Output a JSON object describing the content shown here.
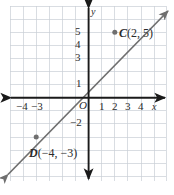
{
  "figure": {
    "type": "coordinate-plane",
    "title": "",
    "width": 174,
    "height": 195,
    "background": "#ffffff",
    "grid": {
      "visible": true,
      "color": "#c9cfd6",
      "cell_px": 13.1,
      "x_range": [
        -6,
        6
      ],
      "y_range": [
        -6,
        7
      ]
    },
    "axes": {
      "color": "#1a1a1a",
      "x_label": "x",
      "y_label": "y",
      "origin_label": "O",
      "x_ticks": [
        "−4",
        "−3",
        "1",
        "2",
        "3",
        "4"
      ],
      "y_ticks": [
        "5",
        "4",
        "3",
        "1",
        "−2"
      ],
      "x_tick_values": [
        -4,
        -3,
        1,
        2,
        3,
        4
      ],
      "y_tick_values": [
        5,
        4,
        3,
        1,
        -2
      ],
      "arrows": [
        "left",
        "right",
        "up",
        "down"
      ]
    },
    "line": {
      "color": "#6f6f6f",
      "through_points": [
        [
          -4,
          -3
        ],
        [
          2,
          5
        ]
      ],
      "slope": "4/3",
      "y_intercept": 2.333,
      "arrows_both_ends": true
    },
    "points": [
      {
        "name": "C",
        "label": "C(2, 5)",
        "label_bold_part": "C",
        "label_rest": "(2, 5)",
        "x": 2,
        "y": 5,
        "marker_color": "#6f6f6f"
      },
      {
        "name": "D",
        "label": "D(−4, −3)",
        "label_bold_part": "D",
        "label_rest": "(−4, −3)",
        "x": -4,
        "y": -3,
        "marker_color": "#6f6f6f"
      }
    ]
  }
}
